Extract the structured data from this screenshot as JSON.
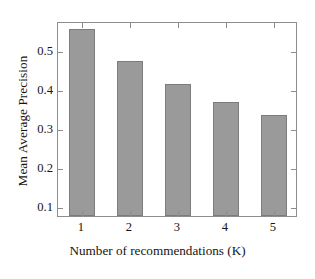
{
  "chart_data": {
    "type": "bar",
    "title": "",
    "subtitle": "",
    "xlabel": "Number of recommendations (K)",
    "ylabel": "Mean Average Precision",
    "categories": [
      "1",
      "2",
      "3",
      "4",
      "5"
    ],
    "values": [
      0.555,
      0.472,
      0.413,
      0.367,
      0.333
    ],
    "series": [
      {
        "name": "Mean Average Precision",
        "values": [
          0.555,
          0.472,
          0.413,
          0.367,
          0.333
        ]
      }
    ],
    "ylim": [
      0.075,
      0.575
    ],
    "xlim": [
      0.5,
      5.5
    ],
    "yticks": [
      0.1,
      0.2,
      0.3,
      0.4,
      0.5
    ],
    "ytick_labels": [
      "0.1",
      "0.2",
      "0.3",
      "0.4",
      "0.5"
    ],
    "xticks": [
      1,
      2,
      3,
      4,
      5
    ],
    "xtick_labels": [
      "1",
      "2",
      "3",
      "4",
      "5"
    ],
    "grid": false,
    "legend": null,
    "legend_position": "none",
    "annotations": [],
    "bar_color": "#9a9a9a",
    "bar_edge_color": "#7c7c7c",
    "frame_color": "#8d8d8d",
    "background_color": "#ffffff",
    "text_color": "#141414"
  }
}
